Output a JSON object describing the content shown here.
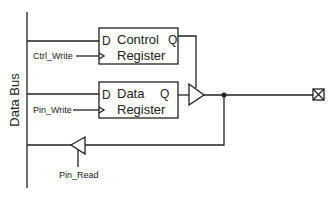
{
  "diagram": {
    "bus_label": "Data Bus",
    "control_register": {
      "d": "D",
      "q": "Q",
      "line1": "Control",
      "line2": "Register",
      "clock_label": "Ctrl_Write"
    },
    "data_register": {
      "d": "D",
      "q": "Q",
      "line1": "Data",
      "line2": "Register",
      "clock_label": "Pin_Write"
    },
    "input_buffer": {
      "enable_label": "Pin_Read"
    },
    "pin": {
      "icon": "pin-pad-icon"
    },
    "colors": {
      "line": "#222222"
    }
  }
}
